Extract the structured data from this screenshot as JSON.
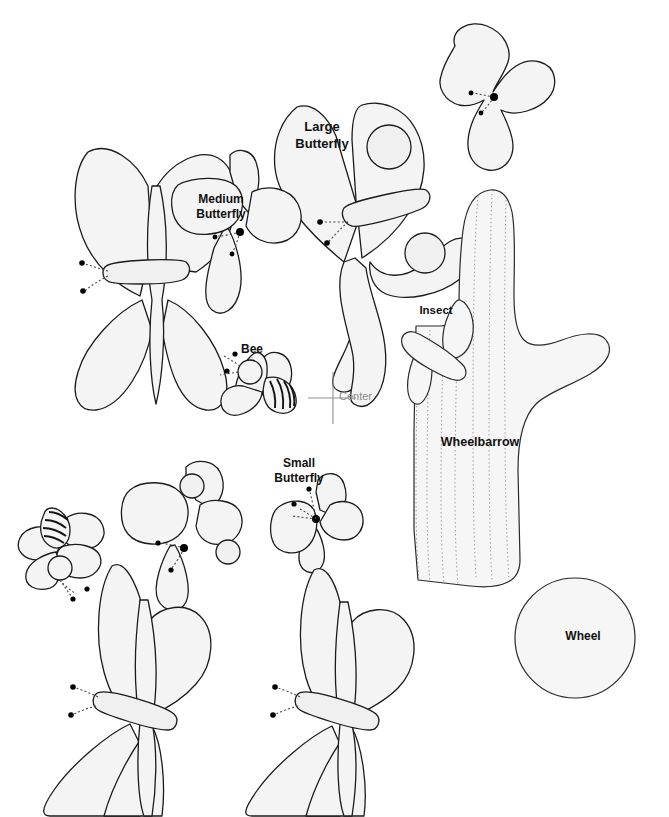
{
  "sheet": {
    "title": "Pattern Template Sheet",
    "background_color": "#ffffff",
    "shape_fill": "#f4f4f4",
    "outline_color": "#1b1b1b",
    "guide_color": "#8f8f8f",
    "width": 669,
    "height": 817
  },
  "labels": {
    "large_butterfly_line1": "Large",
    "large_butterfly_line2": "Butterfly",
    "medium_butterfly_line1": "Medium",
    "medium_butterfly_line2": "Butterfly",
    "small_butterfly_line1": "Small",
    "small_butterfly_line2": "Butterfly",
    "bee": "Bee",
    "insect": "Insect",
    "wheelbarrow": "Wheelbarrow",
    "wheel": "Wheel",
    "center": "Center"
  },
  "pieces": [
    {
      "name": "large-butterfly",
      "label": "Large Butterfly",
      "label_x": 322,
      "label_y": 134
    },
    {
      "name": "medium-butterfly",
      "label": "Medium Butterfly",
      "label_x": 221,
      "label_y": 205
    },
    {
      "name": "small-butterfly",
      "label": "Small Butterfly",
      "label_x": 299,
      "label_y": 470
    },
    {
      "name": "bee",
      "label": "Bee",
      "label_x": 252,
      "label_y": 350
    },
    {
      "name": "insect",
      "label": "Insect",
      "label_x": 436,
      "label_y": 311
    },
    {
      "name": "wheelbarrow",
      "label": "Wheelbarrow",
      "label_x": 480,
      "label_y": 443
    },
    {
      "name": "wheel",
      "label": "Wheel",
      "label_x": 583,
      "label_y": 637
    },
    {
      "name": "center-mark",
      "label": "Center",
      "label_x": 340,
      "label_y": 398
    }
  ],
  "center_mark": {
    "x": 333,
    "y": 398,
    "arm_up": 26,
    "arm_down": 26,
    "arm_left": 25,
    "arm_right": 23,
    "label": "Center"
  }
}
